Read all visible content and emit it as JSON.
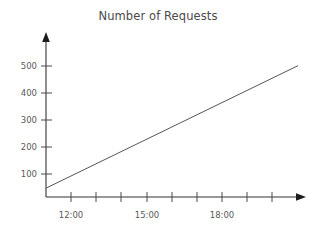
{
  "chart_data": {
    "type": "line",
    "title": "Number of Requests",
    "xlabel": "",
    "ylabel": "",
    "grid": false,
    "legend": false,
    "legend_position": "none",
    "line_color": "#555555",
    "axis_color": "#333333",
    "background_color": "#ffffff",
    "x_type": "time",
    "x_tick_labels": [
      "12:00",
      "15:00",
      "18:00"
    ],
    "x_tick_label_hours": [
      12,
      15,
      18
    ],
    "x_all_tick_hours": [
      11,
      12,
      13,
      14,
      15,
      16,
      17,
      18,
      19,
      20
    ],
    "xlim_hours": [
      10,
      21
    ],
    "y_tick_labels": [
      "100",
      "200",
      "300",
      "400",
      "500"
    ],
    "y_tick_values": [
      100,
      200,
      300,
      400,
      500
    ],
    "ylim": [
      0,
      560
    ],
    "series": [
      {
        "name": "Number of Requests",
        "x_hours": [
          10,
          21
        ],
        "values": [
          33,
          490
        ]
      }
    ],
    "points": [
      {
        "x": "10:00",
        "y": 33
      },
      {
        "x": "12:00",
        "y": 116
      },
      {
        "x": "15:00",
        "y": 241
      },
      {
        "x": "18:00",
        "y": 365
      },
      {
        "x": "21:00",
        "y": 490
      }
    ]
  },
  "axes": {
    "y_axis_name": "y-axis",
    "x_axis_name": "x-axis"
  }
}
